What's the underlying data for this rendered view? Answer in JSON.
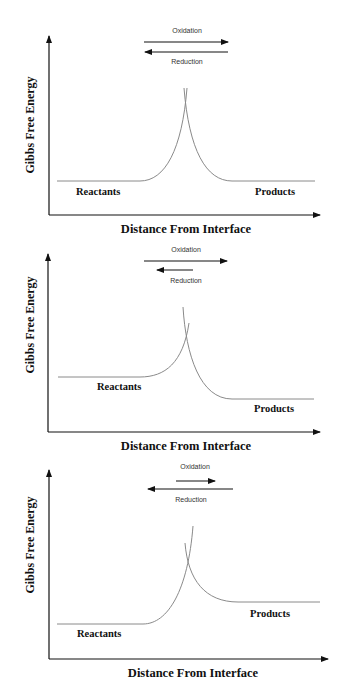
{
  "figure": {
    "panels": [
      {
        "id": "equilibrium",
        "y_label": "Gibbs Free Energy",
        "x_label": "Distance From Interface",
        "reactants_label": "Reactants",
        "products_label": "Products",
        "oxidation_label": "Oxidation",
        "reduction_label": "Reduction",
        "note": "Oxidation and reduction arrows equal length; reactant and product energy levels equal"
      },
      {
        "id": "oxidation-favored",
        "y_label": "Gibbs Free Energy",
        "x_label": "Distance From Interface",
        "reactants_label": "Reactants",
        "products_label": "Products",
        "oxidation_label": "Oxidation",
        "reduction_label": "Reduction",
        "note": "Oxidation arrow longer than reduction arrow; reactants higher than products"
      },
      {
        "id": "reduction-favored",
        "y_label": "Gibbs Free Energy",
        "x_label": "Distance From Interface",
        "reactants_label": "Reactants",
        "products_label": "Products",
        "oxidation_label": "Oxidation",
        "reduction_label": "Reduction",
        "note": "Reduction arrow longer than oxidation arrow; products higher than reactants"
      }
    ],
    "colors": {
      "axis": "#111111",
      "curve": "#8a8a8a",
      "text": "#111111",
      "background": "#ffffff"
    }
  }
}
